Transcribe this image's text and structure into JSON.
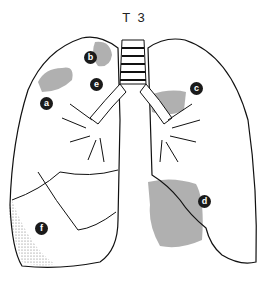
{
  "title": "T 3",
  "labels": [
    {
      "id": "a",
      "text": "a",
      "x": 40,
      "y": 97
    },
    {
      "id": "b",
      "text": "b",
      "x": 84,
      "y": 51
    },
    {
      "id": "c",
      "text": "c",
      "x": 190,
      "y": 82
    },
    {
      "id": "d",
      "text": "d",
      "x": 198,
      "y": 195
    },
    {
      "id": "e",
      "text": "e",
      "x": 90,
      "y": 78
    },
    {
      "id": "f",
      "text": "f",
      "x": 35,
      "y": 222
    }
  ],
  "colors": {
    "shade": "#a8a8a8",
    "outline": "#111111",
    "label_bg": "#1a1a1a"
  }
}
